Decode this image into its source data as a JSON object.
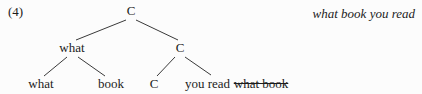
{
  "example_number": "(4)",
  "gloss": "what book you read",
  "tree": {
    "root_label": "C",
    "spec_label": "what",
    "cbar_label": "C",
    "spec_child_left_label": "what",
    "spec_child_right_label": "book",
    "head_label": "C",
    "complement_plain": "you read",
    "complement_struck": "what book"
  },
  "colors": {
    "text": "#1c1c1c",
    "background": "#fcfcfc",
    "edge_line": "#3a3a3a"
  }
}
